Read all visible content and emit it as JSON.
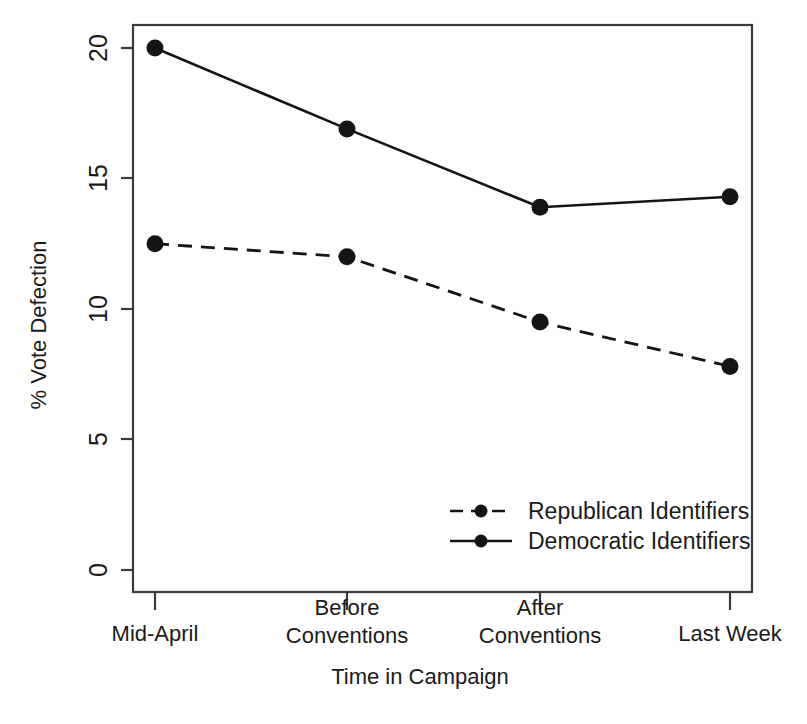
{
  "chart_data": {
    "type": "line",
    "title": "",
    "xlabel": "Time in Campaign",
    "ylabel": "% Vote Defection",
    "categories": [
      "Mid-April",
      "Before Conventions",
      "After Conventions",
      "Last Week"
    ],
    "category_lines": [
      [
        "Mid-April"
      ],
      [
        "Before",
        "Conventions"
      ],
      [
        "After",
        "Conventions"
      ],
      [
        "Last Week"
      ]
    ],
    "series": [
      {
        "name": "Republican Identifiers",
        "values": [
          12.5,
          12.0,
          9.5,
          7.8
        ],
        "line_style": "dashed",
        "marker": "filled-circle",
        "color": "#141414"
      },
      {
        "name": "Democratic Identifiers",
        "values": [
          20.0,
          16.9,
          13.9,
          14.3
        ],
        "line_style": "solid",
        "marker": "filled-circle",
        "color": "#141414"
      }
    ],
    "ylim": [
      -0.85,
      21.6
    ],
    "yticks": [
      0,
      5,
      10,
      15,
      20
    ],
    "ytick_labels": [
      "0",
      "5",
      "10",
      "15",
      "20"
    ],
    "ytick_label_rotation": -90,
    "xlim": [
      0.55,
      4.45
    ],
    "grid": false,
    "legend_position": "bottom-right",
    "frame": true
  },
  "axes": {
    "y_tick_0": "0",
    "y_tick_1": "5",
    "y_tick_2": "10",
    "y_tick_3": "15",
    "y_tick_4": "20",
    "y_title": "% Vote Defection",
    "x_title": "Time in Campaign"
  },
  "xcats": {
    "c0_l0": "Mid-April",
    "c1_l0": "Before",
    "c1_l1": "Conventions",
    "c2_l0": "After",
    "c2_l1": "Conventions",
    "c3_l0": "Last Week"
  },
  "legend": {
    "entry_0_label": "Republican Identifiers",
    "entry_1_label": "Democratic Identifiers"
  },
  "colors": {
    "ink": "#141414",
    "frame": "#3a3a3a",
    "background": "#ffffff"
  }
}
